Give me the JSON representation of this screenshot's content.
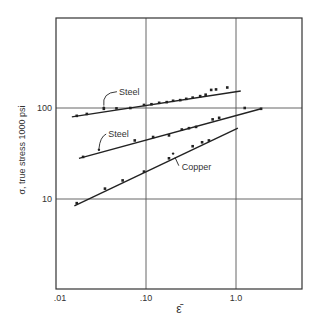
{
  "chart_data": {
    "type": "scatter",
    "title": "",
    "xlabel": "ε̄",
    "ylabel": "σ, true stress  1000 psi",
    "xscale": "log",
    "yscale": "log",
    "xlim": [
      0.01,
      5
    ],
    "ylim": [
      1,
      1000
    ],
    "grid": true,
    "x_ticks": [
      {
        "value": 0.01,
        "label": ".01"
      },
      {
        "value": 0.1,
        "label": ".10"
      },
      {
        "value": 1.0,
        "label": "1.0"
      }
    ],
    "y_ticks": [
      {
        "value": 10,
        "label": "10"
      },
      {
        "value": 100,
        "label": "100"
      }
    ],
    "series": [
      {
        "name": "Steel",
        "label": "Steel",
        "fit_line": {
          "x": [
            0.015,
            1.13
          ],
          "y": [
            80,
            154
          ]
        },
        "points": {
          "x": [
            0.017,
            0.022,
            0.034,
            0.047,
            0.067,
            0.095,
            0.115,
            0.14,
            0.17,
            0.2,
            0.24,
            0.28,
            0.33,
            0.4,
            0.46,
            0.53,
            0.6,
            0.8
          ],
          "y": [
            82,
            86,
            98,
            99,
            100,
            108,
            110,
            114,
            116,
            120,
            122,
            126,
            130,
            135,
            140,
            158,
            160,
            168
          ]
        },
        "label_pos": {
          "x": 0.05,
          "y": 140
        }
      },
      {
        "name": "Steel",
        "label": "Steel",
        "fit_line": {
          "x": [
            0.018,
            1.9
          ],
          "y": [
            28,
            98
          ]
        },
        "points": {
          "x": [
            0.02,
            0.075,
            0.12,
            0.18,
            0.25,
            0.3,
            0.36,
            0.55,
            0.65,
            1.25,
            1.9
          ],
          "y": [
            29,
            44,
            48,
            50,
            58,
            60,
            62,
            75,
            78,
            100,
            98
          ]
        },
        "label_pos": {
          "x": 0.038,
          "y": 48
        }
      },
      {
        "name": "Copper",
        "label": "Copper",
        "fit_line": {
          "x": [
            0.016,
            1.05
          ],
          "y": [
            8.4,
            60
          ]
        },
        "points": {
          "x": [
            0.017,
            0.035,
            0.055,
            0.095,
            0.18,
            0.33,
            0.42,
            0.5
          ],
          "y": [
            9,
            13,
            16,
            20,
            28,
            38,
            42,
            44
          ]
        },
        "label_pos": {
          "x": 0.25,
          "y": 21
        }
      }
    ]
  }
}
